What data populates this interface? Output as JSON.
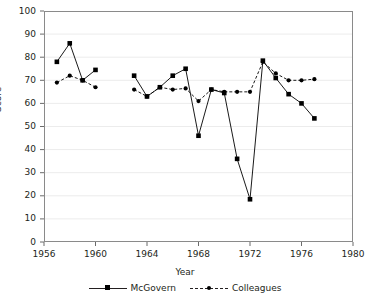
{
  "chart_data": {
    "type": "line",
    "title": "",
    "xlabel": "Year",
    "ylabel": "Score",
    "xlim": [
      1956,
      1980
    ],
    "ylim": [
      0,
      100
    ],
    "xticks": [
      1956,
      1960,
      1964,
      1968,
      1972,
      1976,
      1980
    ],
    "yticks": [
      0,
      10,
      20,
      30,
      40,
      50,
      60,
      70,
      80,
      90,
      100
    ],
    "grid": "horizontal",
    "legend_position": "bottom-center",
    "series": [
      {
        "name": "McGovern",
        "style": "solid",
        "marker": "square",
        "color": "#000000",
        "points": [
          {
            "x": 1957,
            "y": 78
          },
          {
            "x": 1958,
            "y": 86
          },
          {
            "x": 1959,
            "y": 70
          },
          {
            "x": 1960,
            "y": 74.5
          },
          {
            "x": 1963,
            "y": 72
          },
          {
            "x": 1964,
            "y": 63
          },
          {
            "x": 1965,
            "y": 67
          },
          {
            "x": 1966,
            "y": 72
          },
          {
            "x": 1967,
            "y": 75
          },
          {
            "x": 1968,
            "y": 46
          },
          {
            "x": 1969,
            "y": 66
          },
          {
            "x": 1970,
            "y": 64.5
          },
          {
            "x": 1971,
            "y": 36
          },
          {
            "x": 1972,
            "y": 18.5
          },
          {
            "x": 1973,
            "y": 78.5
          },
          {
            "x": 1974,
            "y": 71
          },
          {
            "x": 1975,
            "y": 64
          },
          {
            "x": 1976,
            "y": 60
          },
          {
            "x": 1977,
            "y": 53.5
          }
        ]
      },
      {
        "name": "Colleagues",
        "style": "dashed",
        "marker": "circle",
        "color": "#000000",
        "points": [
          {
            "x": 1957,
            "y": 69
          },
          {
            "x": 1958,
            "y": 72
          },
          {
            "x": 1959,
            "y": 70
          },
          {
            "x": 1960,
            "y": 67
          },
          {
            "x": 1963,
            "y": 66
          },
          {
            "x": 1964,
            "y": 63
          },
          {
            "x": 1965,
            "y": 67
          },
          {
            "x": 1966,
            "y": 66
          },
          {
            "x": 1967,
            "y": 66.5
          },
          {
            "x": 1968,
            "y": 61
          },
          {
            "x": 1969,
            "y": 66
          },
          {
            "x": 1970,
            "y": 65
          },
          {
            "x": 1971,
            "y": 65
          },
          {
            "x": 1972,
            "y": 65
          },
          {
            "x": 1973,
            "y": 78
          },
          {
            "x": 1974,
            "y": 73
          },
          {
            "x": 1975,
            "y": 70
          },
          {
            "x": 1976,
            "y": 70
          },
          {
            "x": 1977,
            "y": 70.5
          }
        ]
      }
    ]
  },
  "axes": {
    "y_title": "Score",
    "x_title": "Year",
    "y_tick_labels": [
      "100",
      "90",
      "80",
      "70",
      "60",
      "50",
      "40",
      "30",
      "20",
      "10",
      "0"
    ],
    "x_tick_labels": [
      "1956",
      "1960",
      "1964",
      "1968",
      "1972",
      "1976",
      "1980"
    ]
  },
  "legend": {
    "entries": [
      {
        "label": "McGovern"
      },
      {
        "label": "Colleagues"
      }
    ]
  }
}
